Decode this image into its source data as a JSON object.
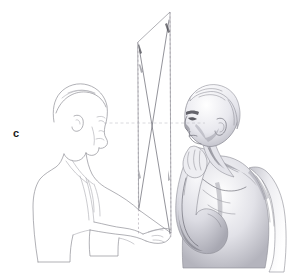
{
  "figure": {
    "label": "c",
    "caption_letter": "c",
    "kind": "perspective drawing demonstration illustration",
    "background_color": "#ffffff",
    "line_color": "#8f8f96",
    "shading_color": "#74747e",
    "label_color": "#1a1a1a",
    "width": 289,
    "height": 278
  },
  "scene": {
    "left_figure": {
      "name": "artist-outline-figure",
      "style": "contour line drawing",
      "description": "man in profile facing right, wearing a jacket, left arm extended forward holding the lower corner of a transparent picture plane"
    },
    "right_figure": {
      "name": "model-shaded-figure",
      "style": "tonal pencil shading",
      "description": "bare-chested male model in three-quarter view, head turned left, one arm raised with hand resting against the jaw"
    },
    "picture_plane": {
      "name": "picture-plane-quadrilateral",
      "description": "tall transparent quadrilateral sheet seen nearly edge-on between the two figures",
      "corners": [
        {
          "name": "top-left",
          "x": 138,
          "y": 42
        },
        {
          "name": "top-right",
          "x": 170,
          "y": 12
        },
        {
          "name": "bottom-right",
          "x": 171,
          "y": 233
        },
        {
          "name": "bottom-left",
          "x": 139,
          "y": 210
        }
      ]
    },
    "construction_lines": {
      "vertical_dashed": [
        {
          "name": "left-vertical-guide",
          "x": 138,
          "y1": 42,
          "y2": 233
        },
        {
          "name": "right-vertical-guide",
          "x": 170,
          "y1": 12,
          "y2": 236
        }
      ],
      "diagonals": [
        {
          "name": "diagonal-upper-left-to-lower-right",
          "x1": 139,
          "y1": 50,
          "x2": 170,
          "y2": 234
        },
        {
          "name": "diagonal-upper-right-to-lower-left",
          "x1": 169,
          "y1": 20,
          "x2": 139,
          "y2": 208
        }
      ],
      "sight_line": {
        "name": "eye-level-sight-line",
        "x1": 104,
        "y1": 123,
        "x2": 205,
        "y2": 123,
        "description": "horizontal line of sight running from the artist's eye through the picture plane to the model's eye"
      },
      "crossing_point": {
        "name": "diagonal-crossing-point",
        "x": 153,
        "y": 123
      }
    }
  }
}
